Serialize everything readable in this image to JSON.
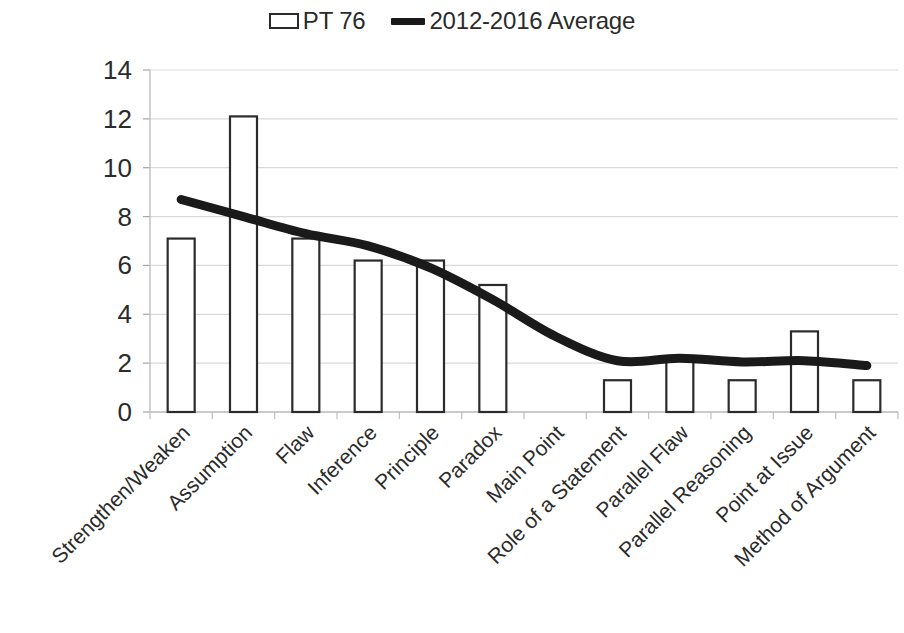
{
  "legend": {
    "items": [
      {
        "label": "PT 76",
        "marker": "bar-swatch-icon",
        "color": "#2b2b2b"
      },
      {
        "label": "2012-2016 Average",
        "marker": "line-swatch-icon",
        "color": "#1a1a1a"
      }
    ]
  },
  "axes": {
    "y_ticks": [
      "0",
      "2",
      "4",
      "6",
      "8",
      "10",
      "12",
      "14"
    ],
    "y_min": 0,
    "y_max": 14,
    "y_step": 2,
    "x_labels_rotation_deg": -45
  },
  "chart_data": {
    "type": "bar",
    "title": "",
    "subtitle": "",
    "xlabel": "",
    "ylabel": "",
    "ylim": [
      0,
      14
    ],
    "ytick_step": 2,
    "grid": true,
    "legend_position": "top-center",
    "categories": [
      "Strengthen/Weaken",
      "Assumption",
      "Flaw",
      "Inference",
      "Principle",
      "Paradox",
      "Main Point",
      "Role of a Statement",
      "Parallel Flaw",
      "Parallel Reasoning",
      "Point at Issue",
      "Method of Argument"
    ],
    "series": [
      {
        "name": "PT 76",
        "type": "bar",
        "color": "#ffffff",
        "edge_color": "#2b2b2b",
        "values": [
          7.1,
          12.1,
          7.1,
          6.2,
          6.2,
          5.2,
          0,
          1.3,
          2.2,
          1.3,
          3.3,
          1.3
        ]
      },
      {
        "name": "2012-2016 Average",
        "type": "line",
        "color": "#1a1a1a",
        "line_width": 9,
        "values": [
          8.7,
          8.0,
          7.3,
          6.8,
          5.9,
          4.6,
          3.1,
          2.1,
          2.2,
          2.05,
          2.1,
          1.9
        ]
      }
    ]
  }
}
